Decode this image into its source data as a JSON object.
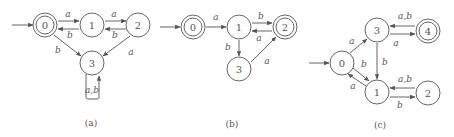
{
  "figure": {
    "panels": [
      {
        "caption": "(a)",
        "states": [
          {
            "id": "0",
            "label": "0",
            "accepting": true,
            "initial": true
          },
          {
            "id": "1",
            "label": "1",
            "accepting": false
          },
          {
            "id": "2",
            "label": "2",
            "accepting": false
          },
          {
            "id": "3",
            "label": "3",
            "accepting": false
          }
        ],
        "transitions": [
          {
            "from": "0",
            "to": "1",
            "label": "a"
          },
          {
            "from": "1",
            "to": "0",
            "label": "b"
          },
          {
            "from": "1",
            "to": "2",
            "label": "a"
          },
          {
            "from": "2",
            "to": "1",
            "label": "b"
          },
          {
            "from": "0",
            "to": "3",
            "label": "b"
          },
          {
            "from": "2",
            "to": "3",
            "label": "a"
          },
          {
            "from": "3",
            "to": "3",
            "label": "a,b"
          }
        ]
      },
      {
        "caption": "(b)",
        "states": [
          {
            "id": "0",
            "label": "0",
            "accepting": true,
            "initial": true
          },
          {
            "id": "1",
            "label": "1",
            "accepting": false
          },
          {
            "id": "2",
            "label": "2",
            "accepting": true
          },
          {
            "id": "3",
            "label": "3",
            "accepting": false
          }
        ],
        "transitions": [
          {
            "from": "0",
            "to": "1",
            "label": "a"
          },
          {
            "from": "1",
            "to": "2",
            "label": "b"
          },
          {
            "from": "2",
            "to": "1",
            "label": "a"
          },
          {
            "from": "1",
            "to": "3",
            "label": "b"
          },
          {
            "from": "3",
            "to": "2",
            "label": "a"
          }
        ]
      },
      {
        "caption": "(c)",
        "states": [
          {
            "id": "0",
            "label": "0",
            "accepting": false,
            "initial": true
          },
          {
            "id": "1",
            "label": "1",
            "accepting": false
          },
          {
            "id": "2",
            "label": "2",
            "accepting": false
          },
          {
            "id": "3",
            "label": "3",
            "accepting": false
          },
          {
            "id": "4",
            "label": "4",
            "accepting": true
          }
        ],
        "transitions": [
          {
            "from": "0",
            "to": "3",
            "label": "a"
          },
          {
            "from": "0",
            "to": "1",
            "label": "b"
          },
          {
            "from": "1",
            "to": "0",
            "label": "a"
          },
          {
            "from": "3",
            "to": "1",
            "label": "b"
          },
          {
            "from": "3",
            "to": "4",
            "label": "a"
          },
          {
            "from": "4",
            "to": "3",
            "label": "a,b"
          },
          {
            "from": "1",
            "to": "2",
            "label": "b"
          },
          {
            "from": "2",
            "to": "1",
            "label": "a,b"
          }
        ]
      }
    ]
  },
  "labels": {
    "a": {
      "s0": "0",
      "s1": "1",
      "s2": "2",
      "s3": "3",
      "e01": "a",
      "e10": "b",
      "e12": "a",
      "e21": "b",
      "e03": "b",
      "e23": "a",
      "e33": "a,b",
      "caption": "(a)"
    },
    "b": {
      "s0": "0",
      "s1": "1",
      "s2": "2",
      "s3": "3",
      "e01": "a",
      "e12": "b",
      "e21": "a",
      "e13": "b",
      "e32": "a",
      "caption": "(b)"
    },
    "c": {
      "s0": "0",
      "s1": "1",
      "s2": "2",
      "s3": "3",
      "s4": "4",
      "e03": "a",
      "e01": "b",
      "e10": "a",
      "e31": "b",
      "e34": "a",
      "e43": "a,b",
      "e12": "b",
      "e21": "a,b",
      "caption": "(c)"
    }
  }
}
